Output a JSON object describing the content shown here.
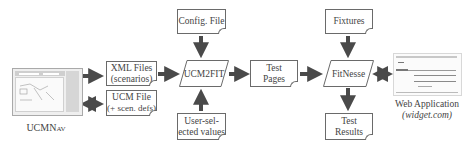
{
  "diagram": {
    "nodes": {
      "ucmnav": {
        "label_main": "UCMN",
        "label_sub": "AV"
      },
      "xml_files": {
        "line1": "XML Files",
        "line2": "(scenarios)"
      },
      "ucm_file": {
        "line1": "UCM File",
        "line2": "(+ scen. defs)"
      },
      "config_file": {
        "line1": "Config. File"
      },
      "ucm2fit": {
        "line1": "UCM2FIT"
      },
      "user_values": {
        "line1": "User-sel-",
        "line2": "ected values"
      },
      "test_pages": {
        "line1": "Test",
        "line2": "Pages"
      },
      "fixtures": {
        "line1": "Fixtures"
      },
      "fitnesse": {
        "line1": "FitNesse"
      },
      "test_results": {
        "line1": "Test Results"
      },
      "web_app": {
        "line1": "Web Application",
        "line2": "(widget.com)"
      }
    },
    "edges": [
      {
        "from": "UCMNav",
        "to": "XML Files (scenarios)",
        "type": "one-way"
      },
      {
        "from": "UCMNav",
        "to": "UCM File (+ scen. defs)",
        "type": "two-way"
      },
      {
        "from": "XML Files (scenarios)",
        "to": "UCM2FIT",
        "type": "one-way"
      },
      {
        "from": "Config. File",
        "to": "UCM2FIT",
        "type": "one-way"
      },
      {
        "from": "User-selected values",
        "to": "UCM2FIT",
        "type": "one-way"
      },
      {
        "from": "UCM2FIT",
        "to": "Test Pages",
        "type": "one-way"
      },
      {
        "from": "Test Pages",
        "to": "FitNesse",
        "type": "one-way"
      },
      {
        "from": "Fixtures",
        "to": "FitNesse",
        "type": "one-way"
      },
      {
        "from": "FitNesse",
        "to": "Test Results",
        "type": "one-way"
      },
      {
        "from": "FitNesse",
        "to": "Web Application (widget.com)",
        "type": "two-way"
      }
    ],
    "colors": {
      "arrow": "#4a4a4a",
      "border": "#6a6a6a",
      "text": "#444444"
    }
  }
}
